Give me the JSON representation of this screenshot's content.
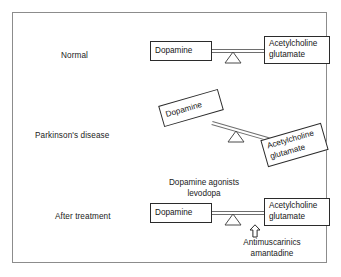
{
  "diagram": {
    "frame_color": "#8c8c8c",
    "box_border_color": "#2b2b2b",
    "beam_color": "#6e6e6e",
    "background": "#ffffff"
  },
  "rows": [
    {
      "id": "normal",
      "label": "Normal",
      "state": "balanced",
      "tilt_degrees": 0,
      "left_node": "Dopamine",
      "right_node_line1": "Acetylcholine",
      "right_node_line2": "glutamate"
    },
    {
      "id": "parkinsons",
      "label": "Parkinson's disease",
      "state": "tilted-dopamine-low",
      "tilt_degrees": 16,
      "left_node": "Dopamine",
      "right_node_line1": "Acetylcholine",
      "right_node_line2": "glutamate"
    },
    {
      "id": "treatment",
      "label": "After treatment",
      "state": "balanced",
      "tilt_degrees": 0,
      "left_node": "Dopamine",
      "right_node_line1": "Acetylcholine",
      "right_node_line2": "glutamate"
    }
  ],
  "annotations": {
    "agonists_line1": "Dopamine agonists",
    "agonists_line2": "levodopa",
    "antimuscarinics_line1": "Antimuscarinics",
    "antimuscarinics_line2": "amantadine",
    "arrow_icon": "up-arrow-icon"
  }
}
